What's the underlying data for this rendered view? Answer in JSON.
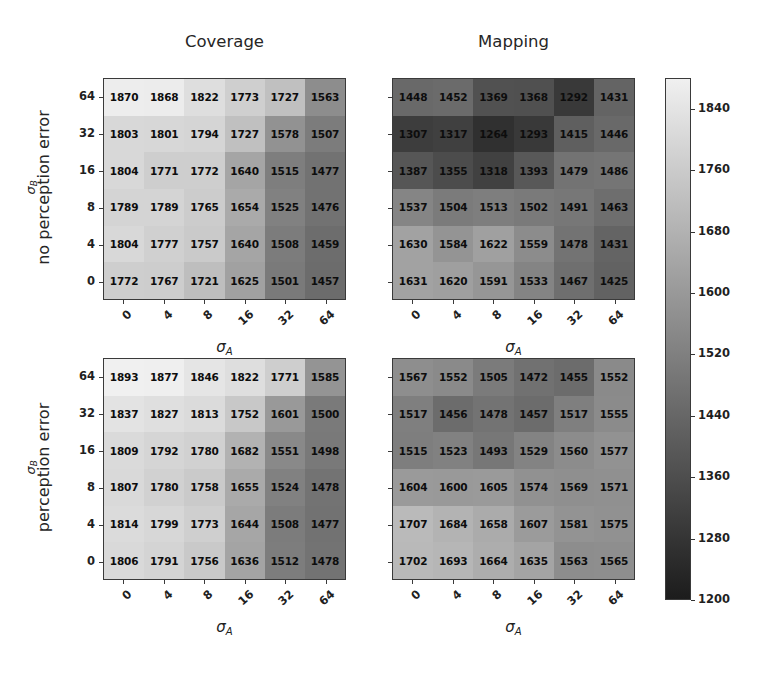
{
  "figure": {
    "column_titles": [
      "Coverage",
      "Mapping"
    ],
    "row_labels": [
      "no perception error",
      "perception error"
    ],
    "xlabel": "σ",
    "xlabel_sub": "A",
    "ylabel": "σ",
    "ylabel_sub": "B",
    "xtick_labels": [
      "0",
      "4",
      "8",
      "16",
      "32",
      "64"
    ],
    "ytick_labels": [
      "64",
      "32",
      "16",
      "8",
      "4",
      "0"
    ],
    "colorbar": {
      "title_main": "t",
      "title_sub_1": "c",
      "title_sep": ", ",
      "title_main_2": "t",
      "title_sub_2": "m",
      "title_full": "t_c, t_m",
      "ticks": [
        "1840",
        "1760",
        "1680",
        "1600",
        "1520",
        "1440",
        "1360",
        "1280",
        "1200"
      ],
      "vmin": 1200,
      "vmax": 1880,
      "cmap": "gray",
      "low_color": "#1c1c1c",
      "high_color": "#f0f0f0"
    }
  },
  "chart_data": [
    {
      "type": "heatmap",
      "title": "Coverage",
      "row_group": "no perception error",
      "xlabel": "σ_A",
      "ylabel": "σ_B",
      "x": [
        "0",
        "4",
        "8",
        "16",
        "32",
        "64"
      ],
      "y": [
        "64",
        "32",
        "16",
        "8",
        "4",
        "0"
      ],
      "values": [
        [
          1870,
          1868,
          1822,
          1773,
          1727,
          1563
        ],
        [
          1803,
          1801,
          1794,
          1727,
          1578,
          1507
        ],
        [
          1804,
          1771,
          1772,
          1640,
          1515,
          1477
        ],
        [
          1789,
          1789,
          1765,
          1654,
          1525,
          1476
        ],
        [
          1804,
          1777,
          1757,
          1640,
          1508,
          1459
        ],
        [
          1772,
          1767,
          1721,
          1625,
          1501,
          1457
        ]
      ],
      "vmin": 1200,
      "vmax": 1880
    },
    {
      "type": "heatmap",
      "title": "Mapping",
      "row_group": "no perception error",
      "xlabel": "σ_A",
      "ylabel": "σ_B",
      "x": [
        "0",
        "4",
        "8",
        "16",
        "32",
        "64"
      ],
      "y": [
        "64",
        "32",
        "16",
        "8",
        "4",
        "0"
      ],
      "values": [
        [
          1448,
          1452,
          1369,
          1368,
          1292,
          1431
        ],
        [
          1307,
          1317,
          1264,
          1293,
          1415,
          1446
        ],
        [
          1387,
          1355,
          1318,
          1393,
          1479,
          1486
        ],
        [
          1537,
          1504,
          1513,
          1502,
          1491,
          1463
        ],
        [
          1630,
          1584,
          1622,
          1559,
          1478,
          1431
        ],
        [
          1631,
          1620,
          1591,
          1533,
          1467,
          1425
        ]
      ],
      "vmin": 1200,
      "vmax": 1880
    },
    {
      "type": "heatmap",
      "title": "Coverage",
      "row_group": "perception error",
      "xlabel": "σ_A",
      "ylabel": "σ_B",
      "x": [
        "0",
        "4",
        "8",
        "16",
        "32",
        "64"
      ],
      "y": [
        "64",
        "32",
        "16",
        "8",
        "4",
        "0"
      ],
      "values": [
        [
          1893,
          1877,
          1846,
          1822,
          1771,
          1585
        ],
        [
          1837,
          1827,
          1813,
          1752,
          1601,
          1500
        ],
        [
          1809,
          1792,
          1780,
          1682,
          1551,
          1498
        ],
        [
          1807,
          1780,
          1758,
          1655,
          1524,
          1478
        ],
        [
          1814,
          1799,
          1773,
          1644,
          1508,
          1477
        ],
        [
          1806,
          1791,
          1756,
          1636,
          1512,
          1478
        ]
      ],
      "vmin": 1200,
      "vmax": 1880
    },
    {
      "type": "heatmap",
      "title": "Mapping",
      "row_group": "perception error",
      "xlabel": "σ_A",
      "ylabel": "σ_B",
      "x": [
        "0",
        "4",
        "8",
        "16",
        "32",
        "64"
      ],
      "y": [
        "64",
        "32",
        "16",
        "8",
        "4",
        "0"
      ],
      "values": [
        [
          1567,
          1552,
          1505,
          1472,
          1455,
          1552
        ],
        [
          1517,
          1456,
          1478,
          1457,
          1517,
          1555
        ],
        [
          1515,
          1523,
          1493,
          1529,
          1560,
          1577
        ],
        [
          1604,
          1600,
          1605,
          1574,
          1569,
          1571
        ],
        [
          1707,
          1684,
          1658,
          1607,
          1581,
          1575
        ],
        [
          1702,
          1693,
          1664,
          1635,
          1563,
          1565
        ]
      ],
      "vmin": 1200,
      "vmax": 1880
    }
  ]
}
